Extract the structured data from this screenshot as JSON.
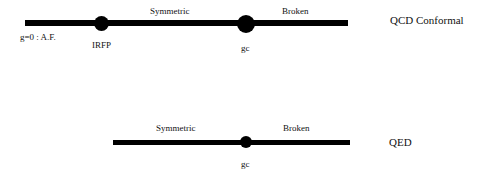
{
  "diagrams": [
    {
      "id": "qcd",
      "title": "QCD Conformal",
      "origin_label": "g=0 : A.F.",
      "regions": [
        {
          "label": "Symmetric"
        },
        {
          "label": "Broken"
        }
      ],
      "points": [
        {
          "label": "IRFP"
        },
        {
          "label": "gc"
        }
      ]
    },
    {
      "id": "qed",
      "title": "QED",
      "regions": [
        {
          "label": "Symmetric"
        },
        {
          "label": "Broken"
        }
      ],
      "points": [
        {
          "label": "gc"
        }
      ]
    }
  ]
}
